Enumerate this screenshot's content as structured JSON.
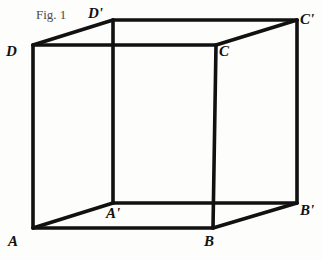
{
  "figure": {
    "caption": "Fig. 1",
    "caption_position": {
      "x": 36,
      "y": 8
    },
    "caption_font_size": 13,
    "background_color": "#fdfdfb",
    "stroke_color": "#111111",
    "stroke_width": 3.6,
    "label_color": "#111111",
    "label_font_size": 15,
    "width": 322,
    "height": 260
  },
  "diagram": {
    "type": "cube-wireframe",
    "vertices": [
      {
        "id": "A",
        "label": "A",
        "x": 33,
        "y": 228,
        "label_x": 8,
        "label_y": 234
      },
      {
        "id": "B",
        "label": "B",
        "x": 213,
        "y": 228,
        "label_x": 204,
        "label_y": 234
      },
      {
        "id": "C",
        "label": "C",
        "x": 216,
        "y": 45,
        "label_x": 219,
        "label_y": 44
      },
      {
        "id": "D",
        "label": "D",
        "x": 33,
        "y": 45,
        "label_x": 6,
        "label_y": 44
      },
      {
        "id": "A1",
        "label": "A'",
        "x": 113,
        "y": 203,
        "label_x": 106,
        "label_y": 206
      },
      {
        "id": "B1",
        "label": "B'",
        "x": 297,
        "y": 203,
        "label_x": 300,
        "label_y": 203
      },
      {
        "id": "C1",
        "label": "C'",
        "x": 297,
        "y": 20,
        "label_x": 300,
        "label_y": 12
      },
      {
        "id": "D1",
        "label": "D'",
        "x": 113,
        "y": 20,
        "label_x": 88,
        "label_y": 6
      }
    ],
    "edges": [
      {
        "name": "edge-D-C",
        "from": "D",
        "to": "C"
      },
      {
        "name": "edge-C-B",
        "from": "C",
        "to": "B"
      },
      {
        "name": "edge-B-A",
        "from": "B",
        "to": "A"
      },
      {
        "name": "edge-A-D",
        "from": "A",
        "to": "D"
      },
      {
        "name": "edge-D1-C1",
        "from": "D1",
        "to": "C1"
      },
      {
        "name": "edge-C1-B1",
        "from": "C1",
        "to": "B1"
      },
      {
        "name": "edge-B1-A1",
        "from": "B1",
        "to": "A1"
      },
      {
        "name": "edge-A1-D1",
        "from": "A1",
        "to": "D1"
      },
      {
        "name": "edge-D-D1",
        "from": "D",
        "to": "D1"
      },
      {
        "name": "edge-C-C1",
        "from": "C",
        "to": "C1"
      },
      {
        "name": "edge-B-B1",
        "from": "B",
        "to": "B1"
      },
      {
        "name": "edge-A-A1",
        "from": "A",
        "to": "A1"
      }
    ]
  }
}
